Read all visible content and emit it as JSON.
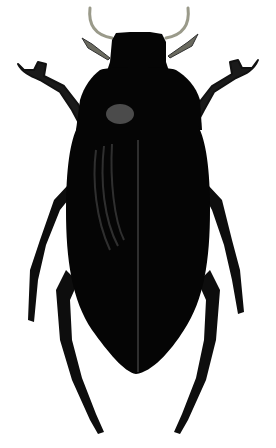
{
  "image": {
    "subject": "beetle illustration",
    "alt": "Black water beetle, dorsal view",
    "background_color": "#ffffff",
    "body_color": "#050505",
    "antenna_color": "#9a9a8a",
    "highlight_color": "#6a6a6a"
  }
}
